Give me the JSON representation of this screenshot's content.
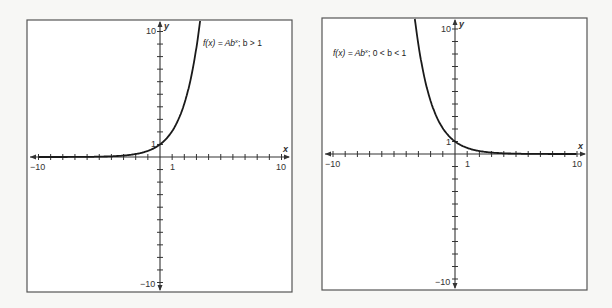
{
  "chart_data": [
    {
      "type": "line",
      "title": "f(x) = Ab^x; b > 1",
      "annotation": {
        "text_prefix": "f(x) = Ab",
        "superscript": "x",
        "text_suffix": "; b > 1"
      },
      "function": "f(x) = 2^x",
      "xlabel": "x",
      "ylabel": "y",
      "xlim": [
        -10,
        10
      ],
      "ylim": [
        -10,
        10
      ],
      "x_tick_labels": [
        "-10",
        "1",
        "10"
      ],
      "y_tick_labels": [
        "10",
        "1",
        "-10"
      ],
      "grid": false,
      "x": [
        -10,
        -6,
        -4,
        -3,
        -2,
        -1,
        0,
        1,
        2,
        3,
        3.3
      ],
      "values": [
        0.001,
        0.016,
        0.063,
        0.125,
        0.25,
        0.5,
        1,
        2,
        4,
        8,
        9.85
      ]
    },
    {
      "type": "line",
      "title": "f(x) = Ab^x; 0 < b < 1",
      "annotation": {
        "text_prefix": "f(x) = Ab",
        "superscript": "x",
        "text_suffix": "; 0 < b < 1"
      },
      "function": "f(x) = 0.5^x",
      "xlabel": "x",
      "ylabel": "y",
      "xlim": [
        -10,
        10
      ],
      "ylim": [
        -10,
        10
      ],
      "x_tick_labels": [
        "-10",
        "1",
        "10"
      ],
      "y_tick_labels": [
        "10",
        "1",
        "-10"
      ],
      "grid": false,
      "x": [
        -3.3,
        -3,
        -2,
        -1,
        0,
        1,
        2,
        3,
        4,
        6,
        10
      ],
      "values": [
        9.85,
        8,
        4,
        2,
        1,
        0.5,
        0.25,
        0.125,
        0.063,
        0.016,
        0.001
      ]
    }
  ],
  "charts": {
    "left": {
      "fn_prefix": "f(x) = Ab",
      "fn_sup": "x",
      "fn_suffix": "; b > 1",
      "x_label": "x",
      "y_label": "y",
      "xmin_label": "−10",
      "xone_label": "1",
      "xmax_label": "10",
      "ymax_label": "10",
      "yone_label": "1",
      "ymin_label": "−10"
    },
    "right": {
      "fn_prefix": "f(x) = Ab",
      "fn_sup": "x",
      "fn_suffix": "; 0 < b < 1",
      "x_label": "x",
      "y_label": "y",
      "xmin_label": "−10",
      "xone_label": "1",
      "xmax_label": "10",
      "ymax_label": "10",
      "yone_label": "1",
      "ymin_label": "−10"
    }
  }
}
